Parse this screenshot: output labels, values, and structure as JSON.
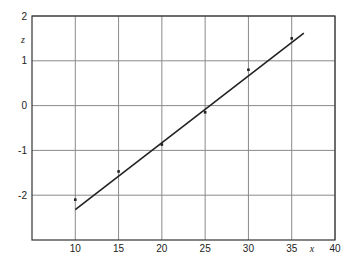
{
  "chart_data": {
    "type": "scatter",
    "title": "",
    "xlabel": "x",
    "ylabel": "z",
    "xlim": [
      5,
      40
    ],
    "ylim": [
      -3,
      2
    ],
    "grid": true,
    "legend": null,
    "x_ticks": [
      10,
      15,
      20,
      25,
      30,
      35,
      40
    ],
    "y_ticks": [
      2,
      1,
      0,
      -1,
      -2
    ],
    "x_tick_labels": [
      "10",
      "15",
      "20",
      "25",
      "30",
      "35",
      "40"
    ],
    "y_tick_labels": [
      "2",
      "1",
      "0",
      "-1",
      "-2"
    ],
    "series": [
      {
        "name": "data points",
        "kind": "scatter",
        "x": [
          10,
          15,
          20,
          25,
          30,
          35
        ],
        "y": [
          -2.1,
          -1.47,
          -0.87,
          -0.15,
          0.8,
          1.5
        ]
      },
      {
        "name": "fit line",
        "kind": "line",
        "x": [
          10,
          36.4
        ],
        "y": [
          -2.32,
          1.62
        ]
      }
    ]
  },
  "colors": {
    "grid": "#8a8a8a",
    "axis": "#333333",
    "line": "#222222",
    "points": "#222222"
  }
}
